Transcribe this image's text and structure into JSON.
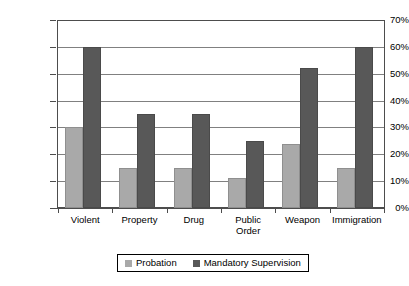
{
  "chart_data": {
    "type": "bar",
    "title": "",
    "xlabel": "",
    "ylabel": "",
    "ylim": [
      0,
      70
    ],
    "grid": true,
    "legend_position": "bottom",
    "categories": [
      "Violent",
      "Property",
      "Drug",
      "Public Order",
      "Weapon",
      "Immigration"
    ],
    "category_lines": [
      [
        "Violent"
      ],
      [
        "Property"
      ],
      [
        "Drug"
      ],
      [
        "Public",
        "Order"
      ],
      [
        "Weapon"
      ],
      [
        "Immigration"
      ]
    ],
    "y_ticks": [
      0,
      10,
      20,
      30,
      40,
      50,
      60,
      70
    ],
    "y_tick_labels": [
      "0%",
      "10%",
      "20%",
      "30%",
      "40%",
      "50%",
      "60%",
      "70%"
    ],
    "series": [
      {
        "name": "Probation",
        "color": "#a9a9a9",
        "values": [
          30,
          15,
          15,
          11,
          24,
          15
        ]
      },
      {
        "name": "Mandatory Supervision",
        "color": "#585858",
        "values": [
          60,
          35,
          35,
          25,
          52,
          60
        ]
      }
    ]
  },
  "legend": {
    "items": [
      {
        "label": "Probation",
        "swatch": "probation"
      },
      {
        "label": "Mandatory Supervision",
        "swatch": "mandatory"
      }
    ]
  }
}
